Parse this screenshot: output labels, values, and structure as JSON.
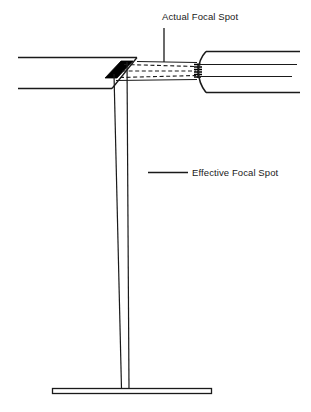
{
  "figure": {
    "domain": "Diagram",
    "background_color": "#ffffff",
    "stroke_color": "#1a1a1a",
    "target_fill_color": "#000000",
    "width": 311,
    "height": 412
  },
  "labels": {
    "actual_focal_spot": "Actual Focal Spot",
    "effective_focal_spot": "Effective Focal Spot"
  },
  "parts": {
    "left_housing": "left-housing-wall",
    "right_housing": "right-housing-wall",
    "anode_target": "anode-target-parallelogram",
    "electron_beam": "dashed-electron-beam",
    "cathode_filament": "cathode-filament-coil",
    "projected_beam": "projected-beam-column",
    "image_receptor": "image-receptor-base"
  },
  "leaders": {
    "actual_leader": "vertical-leader-line",
    "effective_leader": "horizontal-leader-line"
  }
}
